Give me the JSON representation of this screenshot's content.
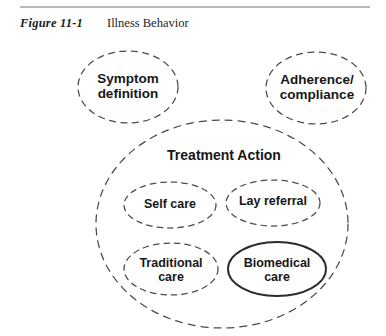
{
  "caption": {
    "figure_number": "Figure 11-1",
    "title": "Illness Behavior"
  },
  "diagram": {
    "type": "venn-nested-ellipses",
    "background_color": "#ffffff",
    "stroke_color": "#4a4a4a",
    "text_color": "#171717",
    "nodes": [
      {
        "id": "symptom-definition",
        "label": "Symptom\ndefinition",
        "border": "dashed",
        "level": "top",
        "cx": 128,
        "cy": 87,
        "rx": 50,
        "ry": 36
      },
      {
        "id": "adherence-compliance",
        "label": "Adherence/\ncompliance",
        "border": "dashed",
        "level": "top",
        "cx": 316,
        "cy": 88,
        "rx": 50,
        "ry": 36
      },
      {
        "id": "treatment-action",
        "label": "Treatment Action",
        "border": "dashed",
        "level": "container",
        "cx": 222,
        "cy": 224,
        "rx": 126,
        "ry": 104
      },
      {
        "id": "self-care",
        "label": "Self care",
        "border": "dashed",
        "level": "inner",
        "cx": 170,
        "cy": 205,
        "rx": 46,
        "ry": 23
      },
      {
        "id": "lay-referral",
        "label": "Lay referral",
        "border": "dashed",
        "level": "inner",
        "cx": 273,
        "cy": 203,
        "rx": 47,
        "ry": 23
      },
      {
        "id": "traditional-care",
        "label": "Traditional\ncare",
        "border": "dashed",
        "level": "inner",
        "cx": 171,
        "cy": 269,
        "rx": 47,
        "ry": 26
      },
      {
        "id": "biomedical-care",
        "label": "Biomedical\ncare",
        "border": "solid",
        "level": "inner",
        "cx": 277,
        "cy": 269,
        "rx": 49,
        "ry": 27
      }
    ]
  }
}
